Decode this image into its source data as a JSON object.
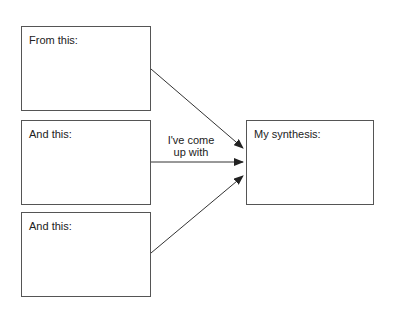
{
  "diagram": {
    "sources": [
      {
        "label": "From this:"
      },
      {
        "label": "And this:"
      },
      {
        "label": "And this:"
      }
    ],
    "target": {
      "label": "My synthesis:"
    },
    "arrow_caption": {
      "line1": "I've come",
      "line2": "up with"
    },
    "colors": {
      "stroke": "#333333",
      "border": "#555555",
      "text": "#222222"
    }
  }
}
